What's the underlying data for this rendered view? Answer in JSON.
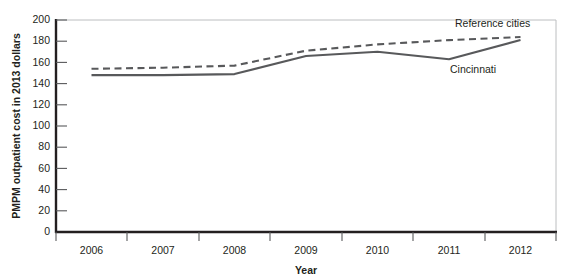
{
  "chart_data": {
    "type": "line",
    "title": "",
    "xlabel": "Year",
    "ylabel": "PMPM outpatient cost in 2013 dollars",
    "categories": [
      "2006",
      "2007",
      "2008",
      "2009",
      "2010",
      "2011",
      "2012"
    ],
    "x": [
      2006,
      2007,
      2008,
      2009,
      2010,
      2011,
      2012
    ],
    "xlim": [
      2005.5,
      2012.5
    ],
    "ylim": [
      0,
      200
    ],
    "y_ticks": [
      0,
      20,
      40,
      60,
      80,
      100,
      120,
      140,
      160,
      180,
      200
    ],
    "x_ticks": [
      "2006",
      "2007",
      "2008",
      "2009",
      "2010",
      "2011",
      "2012"
    ],
    "grid": false,
    "legend_position": "inline-annotation",
    "series": [
      {
        "name": "Reference cities",
        "style": "dashed",
        "color": "#58595b",
        "values": [
          154,
          155,
          157,
          171,
          177,
          181,
          184
        ]
      },
      {
        "name": "Cincinnati",
        "style": "solid",
        "color": "#58595b",
        "values": [
          148,
          148,
          149,
          166,
          170,
          163,
          181
        ]
      }
    ],
    "annotations": [
      {
        "text": "Reference cities",
        "series": "Reference cities"
      },
      {
        "text": "Cincinnati",
        "series": "Cincinnati"
      }
    ]
  },
  "colors": {
    "axis": "#231f20",
    "frame": "#bcbec0",
    "line": "#58595b",
    "text": "#231f20",
    "background": "#ffffff"
  }
}
